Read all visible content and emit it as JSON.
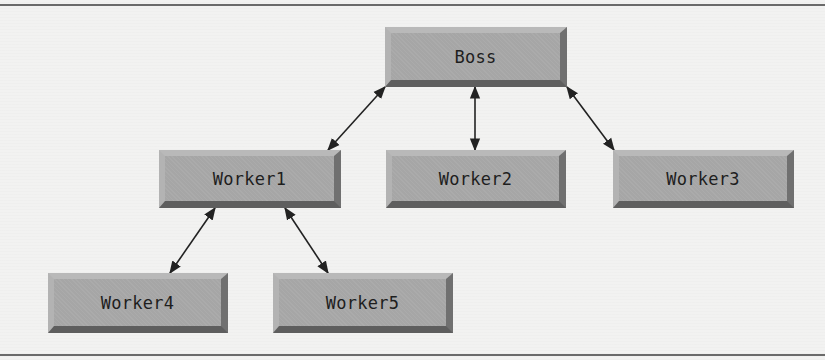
{
  "diagram": {
    "type": "hierarchy",
    "nodes": [
      {
        "id": "boss",
        "label": "Boss",
        "x": 385,
        "y": 27,
        "w": 182,
        "h": 60
      },
      {
        "id": "worker1",
        "label": "Worker1",
        "x": 159,
        "y": 150,
        "w": 182,
        "h": 58
      },
      {
        "id": "worker2",
        "label": "Worker2",
        "x": 386,
        "y": 150,
        "w": 180,
        "h": 58
      },
      {
        "id": "worker3",
        "label": "Worker3",
        "x": 613,
        "y": 150,
        "w": 181,
        "h": 58
      },
      {
        "id": "worker4",
        "label": "Worker4",
        "x": 48,
        "y": 273,
        "w": 180,
        "h": 60
      },
      {
        "id": "worker5",
        "label": "Worker5",
        "x": 273,
        "y": 273,
        "w": 180,
        "h": 60
      }
    ],
    "edges": [
      {
        "from": "boss",
        "to": "worker1",
        "direction": "bidirectional",
        "x1": 385,
        "y1": 87,
        "x2": 328,
        "y2": 150
      },
      {
        "from": "boss",
        "to": "worker2",
        "direction": "bidirectional",
        "x1": 475,
        "y1": 87,
        "x2": 475,
        "y2": 150
      },
      {
        "from": "boss",
        "to": "worker3",
        "direction": "bidirectional",
        "x1": 567,
        "y1": 87,
        "x2": 614,
        "y2": 150
      },
      {
        "from": "worker1",
        "to": "worker4",
        "direction": "bidirectional",
        "x1": 215,
        "y1": 208,
        "x2": 170,
        "y2": 273
      },
      {
        "from": "worker1",
        "to": "worker5",
        "direction": "bidirectional",
        "x1": 285,
        "y1": 208,
        "x2": 328,
        "y2": 273
      }
    ]
  },
  "colors": {
    "node_fill": "#a6a6a6",
    "node_shadow": "#5e5e5e",
    "edge": "#222222",
    "rule": "#6a6a6a"
  }
}
